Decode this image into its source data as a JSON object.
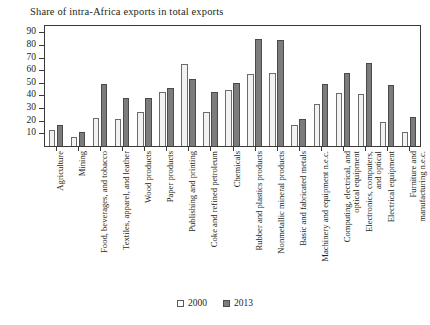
{
  "chart_data": {
    "type": "bar",
    "title": "Share of intra-Africa exports in total exports",
    "xlabel": "",
    "ylabel": "",
    "ylim": [
      0,
      95
    ],
    "yticks": [
      10,
      20,
      30,
      40,
      50,
      60,
      70,
      80,
      90
    ],
    "grid": false,
    "legend_position": "bottom-center",
    "categories": [
      "Agriculture",
      "Mining",
      "Food, beverages, and tobacco",
      "Textiles, apparel, and leather",
      "Wood products",
      "Paper products",
      "Publishing and printing",
      "Coke and refined petroleum",
      "Chemicals",
      "Rubber and plastics products",
      "Nonmetallic mineral products",
      "Basic and fabricated metals",
      "Machinery and equipment n.e.c.",
      "Computing, electrical, and optical equipment",
      "Electronics, computers, and optical",
      "Electrical equipment",
      "Furniture and manufacturing n.e.c."
    ],
    "series": [
      {
        "name": "2000",
        "color": "#f2f2f0",
        "values": [
          13,
          7,
          22,
          21,
          27,
          43,
          65,
          27,
          44,
          57,
          58,
          17,
          33,
          42,
          41,
          19,
          11
        ]
      },
      {
        "name": "2013",
        "color": "#7c7c7c",
        "values": [
          17,
          11,
          49,
          38,
          38,
          46,
          53,
          43,
          50,
          85,
          84,
          21,
          49,
          58,
          66,
          48,
          23
        ]
      }
    ]
  },
  "legend": {
    "items": [
      {
        "label": "2000",
        "swatch": "hollow-square-swatch"
      },
      {
        "label": "2013",
        "swatch": "filled-square-swatch"
      }
    ]
  }
}
